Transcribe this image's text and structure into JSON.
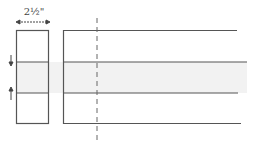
{
  "diagram": {
    "dimension_label": "2½\"",
    "colors": {
      "line": "#555555",
      "band_fill": "#f2f2f2",
      "background": "#ffffff"
    },
    "elements": [
      {
        "name": "folded-strip-end",
        "shape": "rectangle"
      },
      {
        "name": "fabric-strip",
        "shape": "open-rectangle"
      },
      {
        "name": "center-shaded-band",
        "shape": "band"
      },
      {
        "name": "fold-arrow-down",
        "shape": "arrow"
      },
      {
        "name": "fold-arrow-up",
        "shape": "arrow"
      },
      {
        "name": "dashed-cut-line",
        "shape": "dashed-line"
      },
      {
        "name": "width-dimension-arrow",
        "shape": "double-arrow"
      }
    ]
  }
}
